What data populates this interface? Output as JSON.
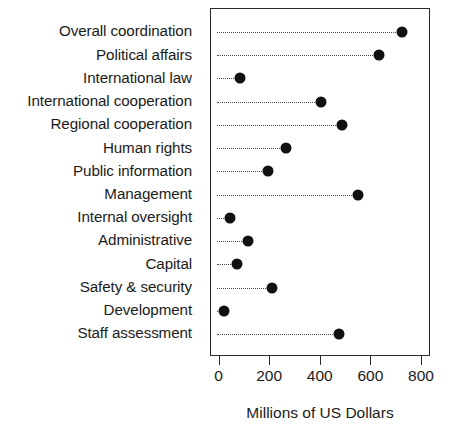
{
  "chart_data": {
    "type": "scatter",
    "subtype": "cleveland-dot-plot",
    "title": "",
    "xlabel": "Millions of US Dollars",
    "ylabel": "",
    "xlim": [
      0,
      800
    ],
    "ylim_categories": 14,
    "grid": "dotted-row-guides",
    "legend": "none",
    "orientation": "horizontal",
    "marker": {
      "shape": "circle",
      "color": "#111111",
      "size_px": 11
    },
    "xticks": [
      0,
      200,
      400,
      600,
      800
    ],
    "xtick_labels": [
      "0",
      "200",
      "400",
      "600",
      "800"
    ],
    "categories": [
      "Overall coordination",
      "Political affairs",
      "International law",
      "International cooperation",
      "Regional cooperation",
      "Human rights",
      "Public information",
      "Management",
      "Internal oversight",
      "Administrative",
      "Capital",
      "Safety & security",
      "Development",
      "Staff assessment"
    ],
    "values": [
      721,
      630,
      81,
      400,
      483,
      263,
      191,
      548,
      42,
      113,
      69,
      207,
      18,
      472
    ],
    "points": [
      {
        "label": "Overall coordination",
        "value": 721
      },
      {
        "label": "Political affairs",
        "value": 630
      },
      {
        "label": "International law",
        "value": 81
      },
      {
        "label": "International cooperation",
        "value": 400
      },
      {
        "label": "Regional cooperation",
        "value": 483
      },
      {
        "label": "Human rights",
        "value": 263
      },
      {
        "label": "Public information",
        "value": 191
      },
      {
        "label": "Management",
        "value": 548
      },
      {
        "label": "Internal oversight",
        "value": 42
      },
      {
        "label": "Administrative",
        "value": 113
      },
      {
        "label": "Capital",
        "value": 69
      },
      {
        "label": "Safety & security",
        "value": 207
      },
      {
        "label": "Development",
        "value": 18
      },
      {
        "label": "Staff assessment",
        "value": 472
      }
    ]
  },
  "axis": {
    "x_title": "Millions of US Dollars"
  },
  "colors": {
    "marker": "#111111",
    "frame": "#2a2a2a",
    "guide": "#4a4a4a",
    "text": "#1b1b1b",
    "background": "#ffffff"
  }
}
